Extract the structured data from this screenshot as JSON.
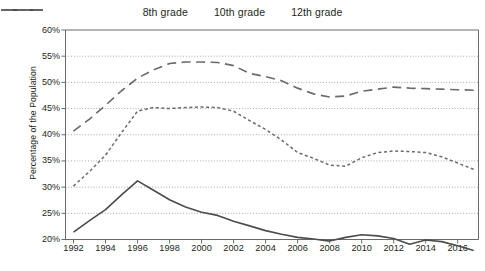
{
  "chart_data": {
    "type": "line",
    "title": "",
    "xlabel": "",
    "ylabel": "Percentage of the Population",
    "x": [
      1992,
      1993,
      1994,
      1995,
      1996,
      1997,
      1998,
      1999,
      2000,
      2001,
      2002,
      2003,
      2004,
      2005,
      2006,
      2007,
      2008,
      2009,
      2010,
      2011,
      2012,
      2013,
      2014,
      2015,
      2016,
      2017
    ],
    "xlim": [
      1991.5,
      2017.3
    ],
    "ylim": [
      20,
      60
    ],
    "xtick_labels": [
      "1992",
      "1994",
      "1996",
      "1998",
      "2000",
      "2002",
      "2004",
      "2006",
      "2008",
      "2010",
      "2012",
      "2014",
      "2016"
    ],
    "xtick_values": [
      1992,
      1994,
      1996,
      1998,
      2000,
      2002,
      2004,
      2006,
      2008,
      2010,
      2012,
      2014,
      2016
    ],
    "ytick_labels": [
      "20%",
      "25%",
      "30%",
      "35%",
      "40%",
      "45%",
      "50%",
      "55%",
      "60%"
    ],
    "ytick_values": [
      20,
      25,
      30,
      35,
      40,
      45,
      50,
      55,
      60
    ],
    "grid": "horizontal-dotted",
    "legend_position": "top-center",
    "series": [
      {
        "name": "8th grade",
        "style": "solid",
        "color": "#4d4d4d",
        "values": [
          21.4,
          23.6,
          25.7,
          28.5,
          31.2,
          29.4,
          27.6,
          26.2,
          25.2,
          24.6,
          23.5,
          22.6,
          21.7,
          21.0,
          20.4,
          20.1,
          19.7,
          20.4,
          20.9,
          20.7,
          20.2,
          19.1,
          19.9,
          19.6,
          18.8,
          17.9
        ]
      },
      {
        "name": "10th grade",
        "style": "dotted",
        "color": "#6b6b6b",
        "values": [
          30.2,
          33.0,
          36.1,
          40.4,
          44.5,
          45.2,
          45.0,
          45.2,
          45.3,
          45.2,
          44.5,
          42.7,
          41.0,
          39.0,
          36.6,
          35.5,
          34.2,
          34.0,
          35.6,
          36.6,
          36.9,
          36.8,
          36.6,
          35.8,
          34.6,
          33.4
        ]
      },
      {
        "name": "12th grade",
        "style": "dashed",
        "color": "#6b6b6b",
        "values": [
          40.7,
          43.0,
          45.6,
          48.4,
          50.8,
          52.4,
          53.6,
          53.9,
          53.9,
          53.8,
          53.2,
          51.7,
          51.1,
          50.3,
          48.9,
          47.8,
          47.2,
          47.4,
          48.3,
          48.7,
          49.1,
          48.9,
          48.8,
          48.7,
          48.6,
          48.5
        ]
      }
    ]
  },
  "legend": {
    "items": [
      {
        "label": "8th grade",
        "swatch": "solid-line-swatch"
      },
      {
        "label": "10th grade",
        "swatch": "dotted-line-swatch"
      },
      {
        "label": "12th grade",
        "swatch": "dashed-line-swatch"
      }
    ]
  },
  "axes": {
    "y_title": "Percentage of the Population"
  },
  "colors": {
    "grid": "#8c8c8c",
    "axis": "#5a5a5a",
    "series_8th": "#4d4d4d",
    "series_10th": "#6b6b6b",
    "series_12th": "#6b6b6b",
    "text": "#231f20",
    "background": "#ffffff"
  }
}
